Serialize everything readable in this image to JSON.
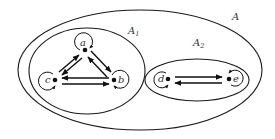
{
  "sets": {
    "outer": {
      "label": "A"
    },
    "a1": {
      "label": "A",
      "sub": "1"
    },
    "a2": {
      "label": "A",
      "sub": "2"
    }
  },
  "nodes": {
    "a": "a",
    "b": "b",
    "c": "c",
    "d": "d",
    "e": "e"
  },
  "edges": [
    {
      "from": "a",
      "to": "b",
      "bidirectional": true
    },
    {
      "from": "a",
      "to": "c",
      "bidirectional": true
    },
    {
      "from": "b",
      "to": "c",
      "bidirectional": true
    },
    {
      "from": "d",
      "to": "e",
      "bidirectional": true
    },
    {
      "from": "a",
      "to": "a",
      "loop": true
    },
    {
      "from": "b",
      "to": "b",
      "loop": true
    },
    {
      "from": "c",
      "to": "c",
      "loop": true
    },
    {
      "from": "d",
      "to": "d",
      "loop": true
    },
    {
      "from": "e",
      "to": "e",
      "loop": true
    }
  ]
}
